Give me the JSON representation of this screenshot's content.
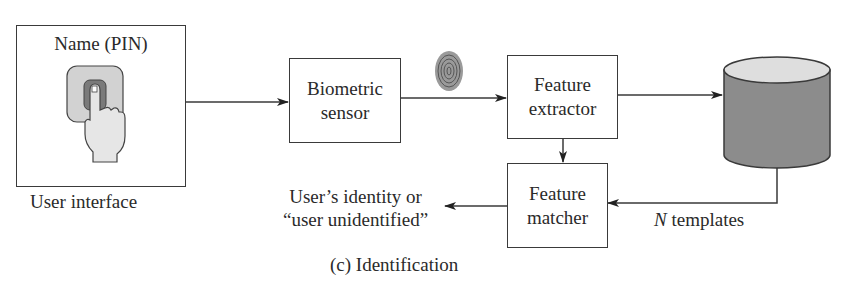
{
  "diagram": {
    "caption": "(c) Identification",
    "nodes": {
      "user_interface": {
        "title": "Name (PIN)",
        "label": "User interface",
        "icon": "finger-press-icon"
      },
      "biometric_sensor": {
        "line1": "Biometric",
        "line2": "sensor"
      },
      "feature_extractor": {
        "line1": "Feature",
        "line2": "extractor"
      },
      "database": {
        "icon": "database-cylinder-icon"
      },
      "feature_matcher": {
        "line1": "Feature",
        "line2": "matcher"
      }
    },
    "output": {
      "line1": "User’s identity or",
      "line2": "“user unidentified”"
    },
    "templates": {
      "n": "N",
      "text": " templates"
    },
    "fingerprint_icon": "fingerprint-icon",
    "colors": {
      "line": "#3a3a3a",
      "cylinder_body": "#8c8c8c",
      "cylinder_top": "#dedede",
      "pad_outer": "#d2d2d2",
      "pad_inner": "#7a7a7a"
    }
  }
}
